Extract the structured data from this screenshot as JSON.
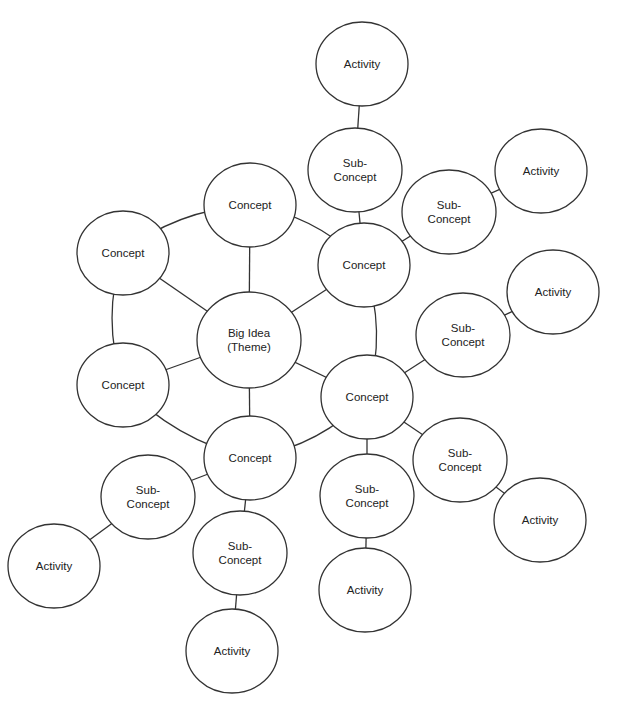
{
  "diagram": {
    "type": "concept-map",
    "nodes": [
      {
        "id": "big",
        "label": [
          "Big Idea",
          "(Theme)"
        ],
        "x": 249,
        "y": 340,
        "rx": 52,
        "ry": 48
      },
      {
        "id": "c1",
        "label": [
          "Concept"
        ],
        "x": 250,
        "y": 205,
        "rx": 46,
        "ry": 42
      },
      {
        "id": "c2",
        "label": [
          "Concept"
        ],
        "x": 364,
        "y": 265,
        "rx": 46,
        "ry": 42
      },
      {
        "id": "c3",
        "label": [
          "Concept"
        ],
        "x": 367,
        "y": 397,
        "rx": 46,
        "ry": 42
      },
      {
        "id": "c4",
        "label": [
          "Concept"
        ],
        "x": 250,
        "y": 458,
        "rx": 46,
        "ry": 42
      },
      {
        "id": "c5",
        "label": [
          "Concept"
        ],
        "x": 123,
        "y": 385,
        "rx": 46,
        "ry": 42
      },
      {
        "id": "c6",
        "label": [
          "Concept"
        ],
        "x": 123,
        "y": 253,
        "rx": 46,
        "ry": 42
      },
      {
        "id": "s1",
        "label": [
          "Sub-",
          "Concept"
        ],
        "x": 355,
        "y": 170,
        "rx": 47,
        "ry": 42
      },
      {
        "id": "s2",
        "label": [
          "Sub-",
          "Concept"
        ],
        "x": 449,
        "y": 212,
        "rx": 47,
        "ry": 42
      },
      {
        "id": "s3",
        "label": [
          "Sub-",
          "Concept"
        ],
        "x": 463,
        "y": 335,
        "rx": 47,
        "ry": 42
      },
      {
        "id": "s4",
        "label": [
          "Sub-",
          "Concept"
        ],
        "x": 460,
        "y": 460,
        "rx": 47,
        "ry": 42
      },
      {
        "id": "s5",
        "label": [
          "Sub-",
          "Concept"
        ],
        "x": 367,
        "y": 496,
        "rx": 47,
        "ry": 42
      },
      {
        "id": "s6",
        "label": [
          "Sub-",
          "Concept"
        ],
        "x": 240,
        "y": 553,
        "rx": 47,
        "ry": 42
      },
      {
        "id": "s7",
        "label": [
          "Sub-",
          "Concept"
        ],
        "x": 148,
        "y": 497,
        "rx": 47,
        "ry": 42
      },
      {
        "id": "a1",
        "label": [
          "Activity"
        ],
        "x": 362,
        "y": 64,
        "rx": 46,
        "ry": 42
      },
      {
        "id": "a2",
        "label": [
          "Activity"
        ],
        "x": 541,
        "y": 171,
        "rx": 46,
        "ry": 42
      },
      {
        "id": "a3",
        "label": [
          "Activity"
        ],
        "x": 553,
        "y": 292,
        "rx": 46,
        "ry": 42
      },
      {
        "id": "a4",
        "label": [
          "Activity"
        ],
        "x": 540,
        "y": 520,
        "rx": 46,
        "ry": 42
      },
      {
        "id": "a5",
        "label": [
          "Activity"
        ],
        "x": 365,
        "y": 590,
        "rx": 46,
        "ry": 42
      },
      {
        "id": "a6",
        "label": [
          "Activity"
        ],
        "x": 232,
        "y": 651,
        "rx": 46,
        "ry": 42
      },
      {
        "id": "a7",
        "label": [
          "Activity"
        ],
        "x": 54,
        "y": 566,
        "rx": 46,
        "ry": 42
      }
    ],
    "edges": [
      [
        "big",
        "c1"
      ],
      [
        "big",
        "c2"
      ],
      [
        "big",
        "c3"
      ],
      [
        "big",
        "c4"
      ],
      [
        "big",
        "c5"
      ],
      [
        "big",
        "c6"
      ],
      [
        "c1",
        "c6"
      ],
      [
        "c1",
        "c2"
      ],
      [
        "c2",
        "c3"
      ],
      [
        "c3",
        "c4"
      ],
      [
        "c4",
        "c5"
      ],
      [
        "c5",
        "c6"
      ],
      [
        "c2",
        "s1"
      ],
      [
        "s1",
        "a1"
      ],
      [
        "c2",
        "s2"
      ],
      [
        "s2",
        "a2"
      ],
      [
        "c3",
        "s3"
      ],
      [
        "s3",
        "a3"
      ],
      [
        "c3",
        "s4"
      ],
      [
        "s4",
        "a4"
      ],
      [
        "c3",
        "s5"
      ],
      [
        "s5",
        "a5"
      ],
      [
        "c4",
        "s6"
      ],
      [
        "s6",
        "a6"
      ],
      [
        "c4",
        "s7"
      ],
      [
        "s7",
        "a7"
      ]
    ]
  }
}
